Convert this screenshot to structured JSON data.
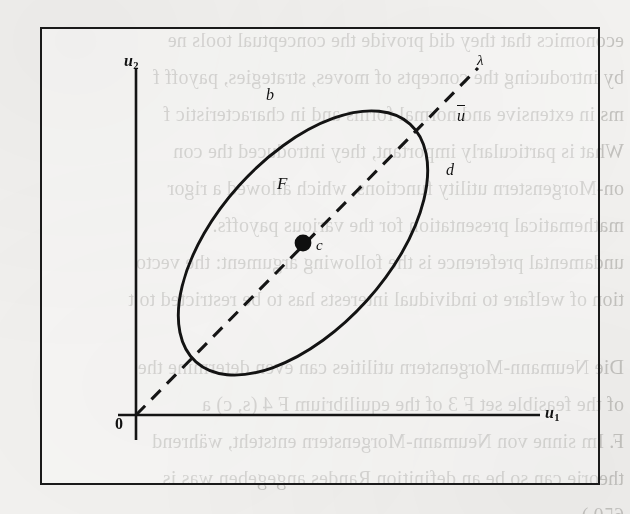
{
  "figure": {
    "frame": {
      "x": 40,
      "y": 27,
      "width": 560,
      "height": 458
    },
    "axes": {
      "x_axis_label": "u",
      "x_axis_subscript": "1",
      "y_axis_label": "u",
      "y_axis_subscript": "2",
      "origin_label": "0"
    },
    "labels": {
      "boundary_upper_left": "b",
      "boundary_right": "d",
      "region": "F",
      "center_point": "c",
      "intersection_point": "u",
      "intersection_point_accent": "bar",
      "ray": "λ"
    },
    "colors": {
      "ink": "#1a1a1a",
      "paper": "#f3f2f0",
      "bleed_text": "#5a5853"
    },
    "geometry": {
      "ellipse_center": [
        303,
        243
      ],
      "ellipse_rx": 160,
      "ellipse_ry": 86,
      "ellipse_rotation_deg": -48,
      "ray_start": [
        136,
        415
      ],
      "ray_end": [
        478,
        68
      ],
      "center_dot_radius": 8
    }
  },
  "bleed_text": {
    "lines": [
      {
        "top": 22,
        "text": "economics that they did provide the conceptual tools ne"
      },
      {
        "top": 59,
        "text": "by introducing the concepts of moves, strategies, payoff f"
      },
      {
        "top": 96,
        "text": "ms in extensive and normal forms and in characteristic f"
      },
      {
        "top": 133,
        "text": "What is particularly important, they introduced the con"
      },
      {
        "top": 170,
        "text": "on-Morgenstern utility functions, which allowed a rigor"
      },
      {
        "top": 207,
        "text": "mathematical presentation for the various payoffs."
      },
      {
        "top": 244,
        "text": "undamental preference is the following argument: the vecto"
      },
      {
        "top": 281,
        "text": "tion of welfare to individual interests has to be restricted to t"
      },
      {
        "top": 318,
        "text": ""
      },
      {
        "top": 349,
        "text": "Die Neumann-Morgenstern utilities can even determine the"
      },
      {
        "top": 386,
        "text": "of the feasible set F 3 of the equilibrium F 4 (s, c) a"
      },
      {
        "top": 423,
        "text": "F. Im sinne von Neumann-Morgenstern entsteht, während"
      },
      {
        "top": 460,
        "text": "theorie can so be an definition Randes angegeben was is"
      },
      {
        "top": 497,
        "text": "650.)"
      }
    ]
  }
}
